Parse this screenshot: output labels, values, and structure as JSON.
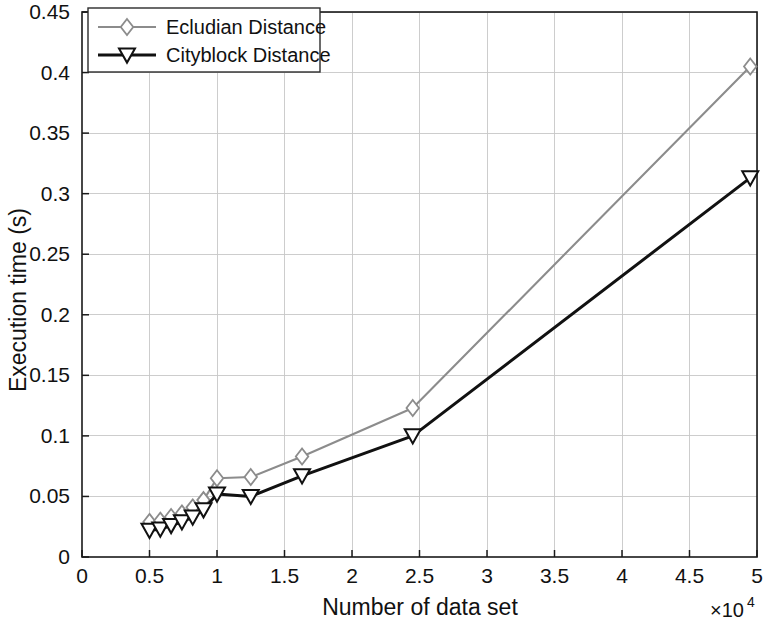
{
  "chart_data": {
    "type": "line",
    "title": "",
    "xlabel": "Number of data set",
    "ylabel": "Execution time (s)",
    "x_multiplier_label": "×10",
    "x_multiplier_exponent": "4",
    "x_multiplier_text": "×10⁴",
    "xlim": [
      0,
      5
    ],
    "ylim": [
      0,
      0.45
    ],
    "xticks": [
      "0",
      "0.5",
      "1",
      "1.5",
      "2",
      "2.5",
      "3",
      "3.5",
      "4",
      "4.5",
      "5"
    ],
    "xtick_values": [
      0,
      0.5,
      1,
      1.5,
      2,
      2.5,
      3,
      3.5,
      4,
      4.5,
      5
    ],
    "yticks": [
      "0",
      "0.05",
      "0.1",
      "0.15",
      "0.2",
      "0.25",
      "0.3",
      "0.35",
      "0.4",
      "0.45"
    ],
    "ytick_values": [
      0,
      0.05,
      0.1,
      0.15,
      0.2,
      0.25,
      0.3,
      0.35,
      0.4,
      0.45
    ],
    "grid": true,
    "legend_position": "top-left",
    "series": [
      {
        "name": "Ecludian Distance",
        "color": "#8c8c8c",
        "marker": "diamond",
        "x": [
          0.5,
          0.58,
          0.66,
          0.74,
          0.82,
          0.9,
          1.0,
          1.25,
          1.63,
          2.45,
          4.95
        ],
        "values": [
          0.029,
          0.03,
          0.033,
          0.036,
          0.041,
          0.047,
          0.065,
          0.066,
          0.083,
          0.123,
          0.405
        ]
      },
      {
        "name": "Cityblock Distance",
        "color": "#111111",
        "marker": "triangle-down",
        "x": [
          0.5,
          0.58,
          0.66,
          0.74,
          0.82,
          0.9,
          1.0,
          1.25,
          1.63,
          2.45,
          4.95
        ],
        "values": [
          0.022,
          0.023,
          0.026,
          0.029,
          0.033,
          0.039,
          0.052,
          0.05,
          0.067,
          0.1,
          0.313
        ]
      }
    ]
  },
  "legend": {
    "items": [
      {
        "label": "Ecludian Distance",
        "color": "#8c8c8c",
        "marker": "diamond"
      },
      {
        "label": "Cityblock Distance",
        "color": "#111111",
        "marker": "triangle-down"
      }
    ]
  },
  "axes": {
    "x_title": "Number of data set",
    "y_title": "Execution time (s)",
    "x_exponent_base": "×10",
    "x_exponent_power": "4"
  }
}
